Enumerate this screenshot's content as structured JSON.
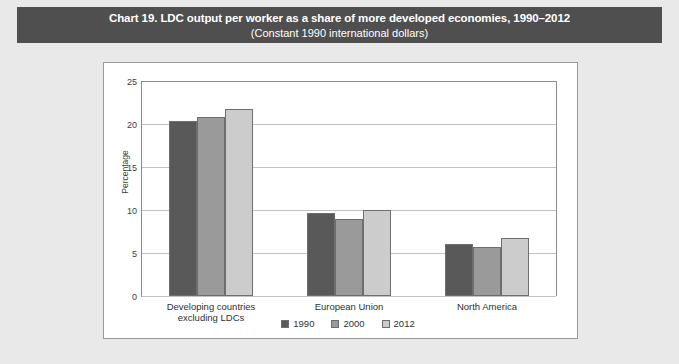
{
  "title": {
    "main": "Chart 19. LDC output per worker as a share of more developed economies, 1990–2012",
    "sub": "(Constant 1990 international dollars)"
  },
  "colors": {
    "banner_bg": "#4f4f4f",
    "banner_text": "#ffffff",
    "page_bg": "#e9e9e9",
    "panel_bg": "#ffffff",
    "panel_border": "#9a9a9a",
    "gridline": "#c2c2c2",
    "axis": "#8c8c8c",
    "series_1990": "#595959",
    "series_2000": "#9a9a9a",
    "series_2012": "#cccccc"
  },
  "chart_data": {
    "type": "bar",
    "title": "Chart 19. LDC output per worker as a share of more developed economies, 1990–2012",
    "subtitle": "(Constant 1990 international dollars)",
    "xlabel": "",
    "ylabel": "Percentage",
    "ylim": [
      0,
      25
    ],
    "yticks": [
      0,
      5,
      10,
      15,
      20,
      25
    ],
    "ytick_labels": [
      "0",
      "5",
      "10",
      "15",
      "20",
      "25"
    ],
    "grid": true,
    "legend_position": "bottom-center",
    "categories": [
      "Developing countries excluding LDCs",
      "European Union",
      "North America"
    ],
    "category_label_lines": [
      [
        "Developing countries",
        "excluding LDCs"
      ],
      [
        "European Union"
      ],
      [
        "North America"
      ]
    ],
    "series": [
      {
        "name": "1990",
        "color": "#595959",
        "values": [
          20.3,
          9.7,
          6.1
        ]
      },
      {
        "name": "2000",
        "color": "#9a9a9a",
        "values": [
          20.8,
          8.9,
          5.7
        ]
      },
      {
        "name": "2012",
        "color": "#cccccc",
        "values": [
          21.8,
          10.0,
          6.8
        ]
      }
    ]
  }
}
